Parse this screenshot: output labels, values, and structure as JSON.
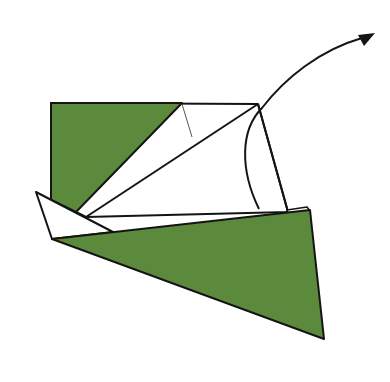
{
  "diagram": {
    "type": "origami-fold-step",
    "width": 390,
    "height": 382,
    "colors": {
      "paper_colored": "#5c8a3c",
      "paper_white": "#ffffff",
      "outline": "#141414",
      "crease": "#555555",
      "arrow": "#141414",
      "background": "#ffffff"
    },
    "shapes": {
      "white_square_back": "51,103 258,104 288,212 86,217 76,212",
      "green_top_left_triangle": "51,103 182,103 76,212 51,200",
      "white_strip_right": "287,210 307,207 310,211 288,213",
      "white_left_flap": "36,192 113,232 52,239",
      "green_bottom_triangle": "52,239 310,210 324,339"
    },
    "lines": {
      "long_diagonal": {
        "x1": 258,
        "y1": 104,
        "x2": 86,
        "y2": 217
      },
      "green_diagonal": {
        "x1": 182,
        "y1": 103,
        "x2": 76,
        "y2": 212
      },
      "right_edge": {
        "x1": 258,
        "y1": 104,
        "x2": 288,
        "y2": 212
      },
      "top_edge": {
        "x1": 51,
        "y1": 103,
        "x2": 258,
        "y2": 104
      },
      "crease_line": {
        "x1": 182,
        "y1": 104,
        "x2": 192,
        "y2": 137
      }
    },
    "arrow": {
      "path": "M259,209 C240,170 240,130 262,108 C285,78 320,50 362,38",
      "head": "375,33 358,35 364,46",
      "meaning": "fold-direction-arrow"
    }
  }
}
